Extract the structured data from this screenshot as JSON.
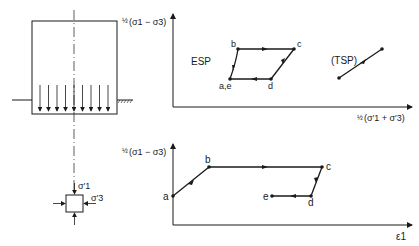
{
  "figure": {
    "type": "stress-path-diagram",
    "colors": {
      "line": "#1a1a1a",
      "background": "#ffffff"
    }
  },
  "foundation_sketch": {
    "description": "Soil element below loaded foundation with uniform downward load",
    "load_arrow_count": 9,
    "element_labels": {
      "sigma1": "σ′1",
      "sigma3": "σ′3"
    }
  },
  "top_plot": {
    "y_axis_label": {
      "frac": "½",
      "expr": "(σ1 − σ3)"
    },
    "x_axis_label": {
      "frac": "½",
      "expr": "(σ′1 + σ′3)"
    },
    "esp_label": "ESP",
    "tsp_label": "(TSP)",
    "points": [
      {
        "name": "b",
        "label": "b"
      },
      {
        "name": "c",
        "label": "c"
      },
      {
        "name": "d",
        "label": "d"
      },
      {
        "name": "ae",
        "label": "a,e"
      }
    ]
  },
  "bottom_plot": {
    "y_axis_label": {
      "frac": "½",
      "expr": "(σ1 − σ3)"
    },
    "x_axis_label": "ε1",
    "points": [
      {
        "name": "a",
        "label": "a"
      },
      {
        "name": "b",
        "label": "b"
      },
      {
        "name": "c",
        "label": "c"
      },
      {
        "name": "d",
        "label": "d"
      },
      {
        "name": "e",
        "label": "e"
      }
    ]
  }
}
